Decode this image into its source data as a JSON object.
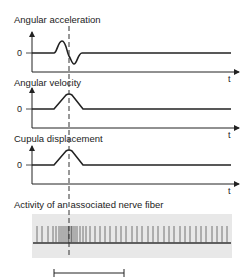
{
  "panels": [
    {
      "title": "Angular acceleration",
      "zero_label": "0",
      "axis_label": "t"
    },
    {
      "title": "Angular velocity",
      "zero_label": "0",
      "axis_label": "t"
    },
    {
      "title": "Cupula displacement",
      "zero_label": "0",
      "axis_label": "t"
    }
  ],
  "nerve": {
    "title": "Activity of an associated nerve fiber",
    "background_color": "#e8e8e8"
  },
  "colors": {
    "line": "#222222",
    "dashed": "#333333"
  }
}
